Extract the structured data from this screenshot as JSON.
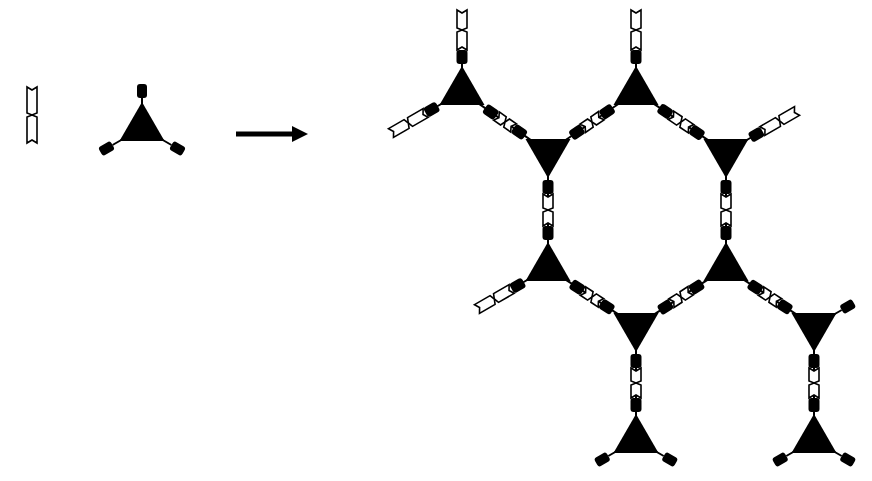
{
  "diagram": {
    "title": "",
    "colors": {
      "ink": "#000000",
      "background": "#ffffff"
    },
    "legend": {
      "linker": {
        "x": 32,
        "y": 115,
        "angle": 90,
        "name": "ditopic-linker"
      },
      "node": {
        "x": 142,
        "y": 128,
        "orientation": "up",
        "name": "tritopic-node"
      },
      "arrow": {
        "x1": 236,
        "y1": 134,
        "x2": 308,
        "y2": 134
      }
    },
    "network": {
      "nodes": [
        {
          "id": "n1",
          "x": 462,
          "y": 92,
          "orientation": "up"
        },
        {
          "id": "n2",
          "x": 636,
          "y": 92,
          "orientation": "up"
        },
        {
          "id": "n3",
          "x": 548,
          "y": 152,
          "orientation": "down"
        },
        {
          "id": "n4",
          "x": 726,
          "y": 152,
          "orientation": "down"
        },
        {
          "id": "n5",
          "x": 548,
          "y": 268,
          "orientation": "up"
        },
        {
          "id": "n6",
          "x": 726,
          "y": 268,
          "orientation": "up"
        },
        {
          "id": "n7",
          "x": 636,
          "y": 326,
          "orientation": "down"
        },
        {
          "id": "n8",
          "x": 814,
          "y": 326,
          "orientation": "down"
        },
        {
          "id": "n9",
          "x": 636,
          "y": 440,
          "orientation": "up"
        },
        {
          "id": "n10",
          "x": 814,
          "y": 440,
          "orientation": "up"
        }
      ],
      "bonds": [
        [
          "n1",
          "n3"
        ],
        [
          "n3",
          "n2"
        ],
        [
          "n2",
          "n4"
        ],
        [
          "n3",
          "n5"
        ],
        [
          "n4",
          "n6"
        ],
        [
          "n5",
          "n7"
        ],
        [
          "n7",
          "n6"
        ],
        [
          "n6",
          "n8"
        ],
        [
          "n7",
          "n9"
        ],
        [
          "n8",
          "n10"
        ]
      ],
      "dangling_linkers": [
        {
          "from": "n1",
          "dir": "up"
        },
        {
          "from": "n1",
          "dir": "lower-left"
        },
        {
          "from": "n2",
          "dir": "up"
        },
        {
          "from": "n4",
          "dir": "upper-right"
        },
        {
          "from": "n5",
          "dir": "lower-left"
        }
      ],
      "capped_arms": [
        {
          "from": "n8",
          "dir": "upper-right"
        },
        {
          "from": "n9",
          "dir": "lower-left"
        },
        {
          "from": "n9",
          "dir": "lower-right"
        },
        {
          "from": "n10",
          "dir": "lower-left"
        },
        {
          "from": "n10",
          "dir": "lower-right"
        }
      ]
    }
  }
}
